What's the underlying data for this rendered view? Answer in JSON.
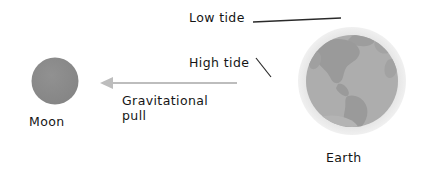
{
  "diagram": {
    "background_color": "#ffffff",
    "bodies": {
      "moon": {
        "label": "Moon",
        "shape": "circle",
        "center_x": 55,
        "center_y": 81,
        "diameter": 47,
        "fill_color": "#8a8a8a"
      },
      "earth": {
        "label": "Earth",
        "shape": "circle",
        "center_x": 352,
        "center_y": 81,
        "globe_diameter": 92,
        "halo_diameter": 108,
        "globe_color": "#adadad",
        "halo_color": "#e4e4e4",
        "continent_color": "#9a9a9a",
        "continents_shown": "Americas"
      }
    },
    "annotations": [
      {
        "id": "low-tide",
        "label": "Low tide",
        "leader": "horizontal-line-to-earth-top",
        "points_to": "top of Earth's water halo"
      },
      {
        "id": "high-tide",
        "label": "High tide",
        "leader": "short-diagonal-line",
        "points_to": "left bulge of Earth's water halo"
      },
      {
        "id": "gravitational-pull",
        "label_line1": "Gravitational",
        "label_line2": "pull",
        "leader": "left-pointing-arrow",
        "arrow_color": "#bdbdbd",
        "arrow_from_x": 237,
        "arrow_to_x": 100,
        "arrow_y": 83,
        "direction": "from Earth toward Moon"
      }
    ],
    "leader_line_color": "#2a2a2a"
  }
}
